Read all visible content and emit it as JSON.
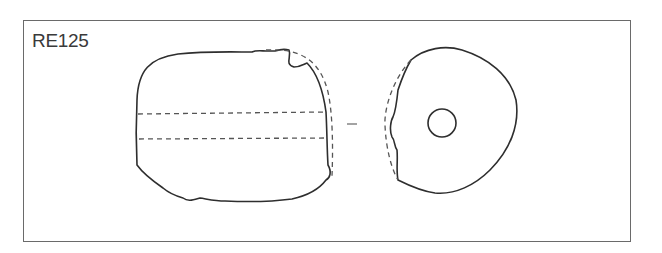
{
  "figure": {
    "label": "RE125",
    "views": [
      {
        "name": "side-view",
        "description": "bead profile with perforation shown as dashed lines"
      },
      {
        "name": "end-view",
        "description": "bead end with central perforation"
      }
    ],
    "separator": "-"
  }
}
